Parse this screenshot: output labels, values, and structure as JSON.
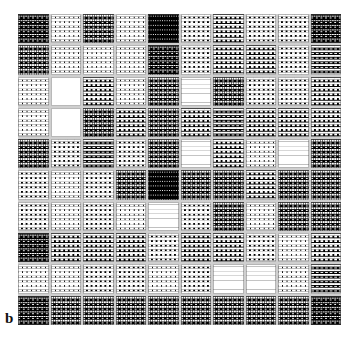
{
  "figure": {
    "panel_letter": "b",
    "type": "halftone-matrix",
    "rows": 10,
    "columns": 10,
    "background_color": "#ffffff",
    "gridline_color": "#cfcfcf",
    "ink_color": "#000000",
    "dot_color": "#ffffff"
  },
  "chart_data": {
    "type": "heatmap",
    "title": "",
    "subtitle": "",
    "xlabel": "",
    "ylabel": "",
    "grid": true,
    "legend": "none",
    "annotations": [
      "b"
    ],
    "colormap": "grayscale-halftone",
    "value_range": [
      0,
      100
    ],
    "value_meaning": "cell lightness (0 = solid black, 100 = solid white)",
    "x": [
      1,
      2,
      3,
      4,
      5,
      6,
      7,
      8,
      9,
      10
    ],
    "y": [
      1,
      2,
      3,
      4,
      5,
      6,
      7,
      8,
      9,
      10
    ],
    "xticklabels": [
      "",
      "",
      "",
      "",
      "",
      "",
      "",
      "",
      "",
      ""
    ],
    "yticklabels": [
      "",
      "",
      "",
      "",
      "",
      "",
      "",
      "",
      "",
      ""
    ],
    "values": [
      [
        14,
        58,
        20,
        50,
        6,
        44,
        40,
        42,
        46,
        14
      ],
      [
        22,
        74,
        66,
        76,
        12,
        48,
        40,
        40,
        44,
        26
      ],
      [
        50,
        100,
        40,
        60,
        16,
        82,
        24,
        46,
        44,
        30
      ],
      [
        52,
        100,
        22,
        34,
        24,
        38,
        26,
        36,
        40,
        30
      ],
      [
        20,
        48,
        26,
        46,
        18,
        86,
        34,
        80,
        84,
        22
      ],
      [
        44,
        70,
        42,
        18,
        6,
        22,
        22,
        40,
        24,
        20
      ],
      [
        46,
        76,
        44,
        62,
        92,
        44,
        20,
        66,
        22,
        24
      ],
      [
        10,
        30,
        32,
        30,
        46,
        32,
        30,
        46,
        70,
        28
      ],
      [
        52,
        80,
        46,
        48,
        78,
        42,
        92,
        92,
        50,
        26
      ],
      [
        14,
        20,
        22,
        22,
        20,
        22,
        22,
        24,
        24,
        14
      ]
    ]
  }
}
